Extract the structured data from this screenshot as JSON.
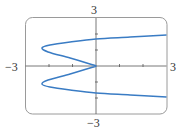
{
  "chart_data": {
    "type": "line",
    "title": "",
    "xlabel": "",
    "ylabel": "",
    "xlim": [
      -3,
      3
    ],
    "ylim": [
      -3,
      3
    ],
    "grid": false,
    "legend": null,
    "axis_labels": {
      "x_min": "−3",
      "x_max": "3",
      "y_min": "−3",
      "y_max": "3"
    },
    "x_ticks": [
      -2,
      -1,
      0,
      1,
      2
    ],
    "y_ticks": [
      -2,
      -1,
      0,
      1,
      2
    ],
    "series": [
      {
        "name": "curve",
        "color": "#3a7cc4",
        "points": [
          [
            3.0,
            -1.94
          ],
          [
            1.45,
            -1.81
          ],
          [
            0.0,
            -1.69
          ],
          [
            -1.1,
            -1.5
          ],
          [
            -1.96,
            -1.31
          ],
          [
            -2.3,
            -1.13
          ],
          [
            -2.04,
            -0.88
          ],
          [
            -1.1,
            -0.5
          ],
          [
            -0.26,
            -0.13
          ],
          [
            0.0,
            0.0
          ],
          [
            -0.26,
            0.13
          ],
          [
            -1.1,
            0.5
          ],
          [
            -2.04,
            0.88
          ],
          [
            -2.3,
            1.13
          ],
          [
            -1.96,
            1.31
          ],
          [
            -1.1,
            1.5
          ],
          [
            0.0,
            1.69
          ],
          [
            1.45,
            1.81
          ],
          [
            3.0,
            1.94
          ]
        ]
      }
    ]
  },
  "colors": {
    "curve": "#3a7cc4",
    "axes": "#555555",
    "frame": "#9a9a9a"
  }
}
